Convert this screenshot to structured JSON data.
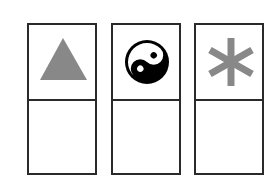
{
  "diagram": {
    "cards": [
      {
        "symbol": "triangle",
        "symbol_icon": "triangle-icon",
        "symbol_color": "#888888",
        "bottom_text": ""
      },
      {
        "symbol": "yin-yang",
        "symbol_icon": "yin-yang-icon",
        "symbol_color": "#000000",
        "bottom_text": ""
      },
      {
        "symbol": "asterisk",
        "symbol_icon": "asterisk-icon",
        "symbol_color": "#888888",
        "bottom_text": ""
      }
    ],
    "border_color": "#2a2a2a"
  }
}
